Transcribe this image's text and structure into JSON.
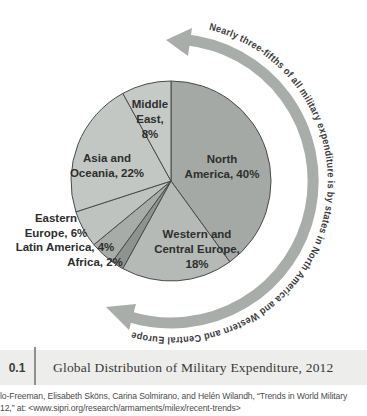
{
  "figure": {
    "caption_number": "0.1",
    "caption_title": "Global Distribution of Military Expenditure, 2012",
    "source_line1": "lo-Freeman, Elisabeth Sköns, Carina Solmirano, and Helén Wilandh, “Trends in World Military",
    "source_line2": "12,” at: <www.sipri.org/research/armaments/milex/recent-trends>"
  },
  "chart_data": {
    "type": "pie",
    "title": "Global Distribution of Military Expenditure, 2012",
    "units": "percent",
    "direction": "clockwise",
    "start_angle_deg": 0,
    "annotation": "Nearly three-fifths of all military expenditure is by states in North America and Western and Central Europe",
    "arrow_color": "#a8ada9",
    "outline_color": "#4a4a4a",
    "slices": [
      {
        "label": "North America",
        "value": 40,
        "color": "#a4a9a5",
        "label_lines": [
          "North",
          "America, 40%"
        ]
      },
      {
        "label": "Western and Central Europe",
        "value": 18,
        "color": "#b5bab6",
        "label_lines": [
          "Western and",
          "Central Europe,",
          "18%"
        ]
      },
      {
        "label": "Africa",
        "value": 2,
        "color": "#8e938f",
        "label_lines": [
          "Africa, 2%"
        ]
      },
      {
        "label": "Latin America",
        "value": 4,
        "color": "#a7aca8",
        "label_lines": [
          "Latin America, 4%"
        ]
      },
      {
        "label": "Eastern Europe",
        "value": 6,
        "color": "#bec3bf",
        "label_lines": [
          "Eastern",
          "Europe, 6%"
        ]
      },
      {
        "label": "Asia and Oceania",
        "value": 22,
        "color": "#c3c7c3",
        "label_lines": [
          "Asia and",
          "Oceania, 22%"
        ]
      },
      {
        "label": "Middle East",
        "value": 8,
        "color": "#c6cac6",
        "label_lines": [
          "Middle",
          "East,",
          "8%"
        ]
      }
    ]
  }
}
